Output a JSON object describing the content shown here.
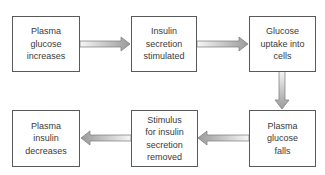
{
  "diagram": {
    "type": "flowchart",
    "colors": {
      "box_border": "#5a5a5a",
      "text": "#3a3a3a",
      "arrow_dark": "#9a9a9a",
      "arrow_light": "#f4f4f4",
      "arrow_outline": "#7a7a7a"
    },
    "nodes": [
      {
        "id": "n1",
        "lines": [
          "Plasma",
          "glucose",
          "increases"
        ]
      },
      {
        "id": "n2",
        "lines": [
          "Insulin",
          "secretion",
          "stimulated"
        ]
      },
      {
        "id": "n3",
        "lines": [
          "Glucose",
          "uptake into",
          "cells"
        ]
      },
      {
        "id": "n4",
        "lines": [
          "Plasma",
          "glucose",
          "falls"
        ]
      },
      {
        "id": "n5",
        "lines": [
          "Stimulus",
          "for insulin",
          "secretion",
          "removed"
        ]
      },
      {
        "id": "n6",
        "lines": [
          "Plasma",
          "insulin",
          "decreases"
        ]
      }
    ],
    "edges": [
      {
        "from": "n1",
        "to": "n2",
        "direction": "right"
      },
      {
        "from": "n2",
        "to": "n3",
        "direction": "right"
      },
      {
        "from": "n3",
        "to": "n4",
        "direction": "down"
      },
      {
        "from": "n4",
        "to": "n5",
        "direction": "left"
      },
      {
        "from": "n5",
        "to": "n6",
        "direction": "left"
      }
    ]
  }
}
